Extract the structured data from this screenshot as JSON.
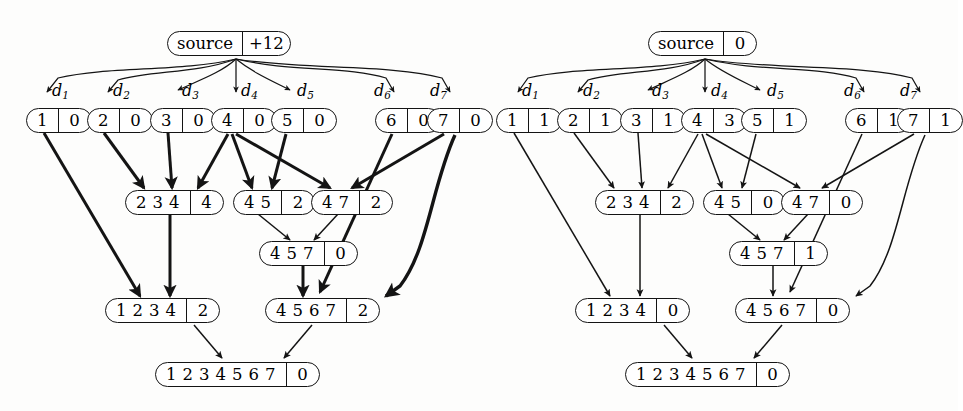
{
  "figure": {
    "panels": [
      {
        "id": "left",
        "name": "left-panel",
        "source": {
          "label": "source",
          "counter": "+12"
        },
        "edge_labels": [
          {
            "name": "d1",
            "text": "d",
            "sub": "1"
          },
          {
            "name": "d2",
            "text": "d",
            "sub": "2"
          },
          {
            "name": "d3",
            "text": "d",
            "sub": "3"
          },
          {
            "name": "d4",
            "text": "d",
            "sub": "4"
          },
          {
            "name": "d5",
            "text": "d",
            "sub": "5"
          },
          {
            "name": "d6",
            "text": "d",
            "sub": "6"
          },
          {
            "name": "d7",
            "text": "d",
            "sub": "7"
          }
        ],
        "nodes": [
          {
            "id": "L1",
            "cells": [
              "1"
            ],
            "counter": "0"
          },
          {
            "id": "L2",
            "cells": [
              "2"
            ],
            "counter": "0"
          },
          {
            "id": "L3",
            "cells": [
              "3"
            ],
            "counter": "0"
          },
          {
            "id": "L4",
            "cells": [
              "4"
            ],
            "counter": "0"
          },
          {
            "id": "L5",
            "cells": [
              "5"
            ],
            "counter": "0"
          },
          {
            "id": "L6",
            "cells": [
              "6"
            ],
            "counter": "0"
          },
          {
            "id": "L7",
            "cells": [
              "7"
            ],
            "counter": "0"
          },
          {
            "id": "M1",
            "cells": [
              "2",
              "3",
              "4"
            ],
            "counter": "4"
          },
          {
            "id": "M2",
            "cells": [
              "4",
              "5"
            ],
            "counter": "2"
          },
          {
            "id": "M3",
            "cells": [
              "4",
              "7"
            ],
            "counter": "2"
          },
          {
            "id": "M4",
            "cells": [
              "4",
              "5",
              "7"
            ],
            "counter": "0"
          },
          {
            "id": "B1",
            "cells": [
              "1",
              "2",
              "3",
              "4"
            ],
            "counter": "2"
          },
          {
            "id": "B2",
            "cells": [
              "4",
              "5",
              "6",
              "7"
            ],
            "counter": "2"
          },
          {
            "id": "R",
            "cells": [
              "1",
              "2",
              "3",
              "4",
              "5",
              "6",
              "7"
            ],
            "counter": "0"
          }
        ]
      },
      {
        "id": "right",
        "name": "right-panel",
        "source": {
          "label": "source",
          "counter": "0"
        },
        "edge_labels": [
          {
            "name": "d1",
            "text": "d",
            "sub": "1"
          },
          {
            "name": "d2",
            "text": "d",
            "sub": "2"
          },
          {
            "name": "d3",
            "text": "d",
            "sub": "3"
          },
          {
            "name": "d4",
            "text": "d",
            "sub": "4"
          },
          {
            "name": "d5",
            "text": "d",
            "sub": "5"
          },
          {
            "name": "d6",
            "text": "d",
            "sub": "6"
          },
          {
            "name": "d7",
            "text": "d",
            "sub": "7"
          }
        ],
        "nodes": [
          {
            "id": "L1",
            "cells": [
              "1"
            ],
            "counter": "1"
          },
          {
            "id": "L2",
            "cells": [
              "2"
            ],
            "counter": "1"
          },
          {
            "id": "L3",
            "cells": [
              "3"
            ],
            "counter": "1"
          },
          {
            "id": "L4",
            "cells": [
              "4"
            ],
            "counter": "3"
          },
          {
            "id": "L5",
            "cells": [
              "5"
            ],
            "counter": "1"
          },
          {
            "id": "L6",
            "cells": [
              "6"
            ],
            "counter": "1"
          },
          {
            "id": "L7",
            "cells": [
              "7"
            ],
            "counter": "1"
          },
          {
            "id": "M1",
            "cells": [
              "2",
              "3",
              "4"
            ],
            "counter": "2"
          },
          {
            "id": "M2",
            "cells": [
              "4",
              "5"
            ],
            "counter": "0"
          },
          {
            "id": "M3",
            "cells": [
              "4",
              "7"
            ],
            "counter": "0"
          },
          {
            "id": "M4",
            "cells": [
              "4",
              "5",
              "7"
            ],
            "counter": "1"
          },
          {
            "id": "B1",
            "cells": [
              "1",
              "2",
              "3",
              "4"
            ],
            "counter": "0"
          },
          {
            "id": "B2",
            "cells": [
              "4",
              "5",
              "6",
              "7"
            ],
            "counter": "0"
          },
          {
            "id": "R",
            "cells": [
              "1",
              "2",
              "3",
              "4",
              "5",
              "6",
              "7"
            ],
            "counter": "0"
          }
        ]
      }
    ],
    "colors": {
      "stroke": "#141414",
      "background": "#fdfdfc"
    }
  }
}
